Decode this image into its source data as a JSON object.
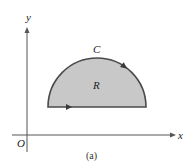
{
  "figure": {
    "caption": "(a)",
    "axes": {
      "x_label": "x",
      "y_label": "y",
      "origin_label": "O"
    },
    "region": {
      "label": "R",
      "shape": "semicircle",
      "fill_color": "#c8c8c8",
      "edge_color": "#4a4a4a"
    },
    "curve": {
      "label": "C",
      "orientation": "counterclockwise"
    },
    "colors": {
      "axis": "#555555",
      "text": "#222222"
    }
  }
}
